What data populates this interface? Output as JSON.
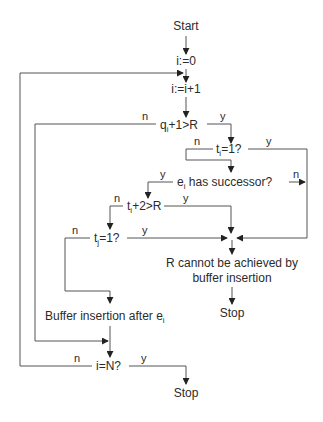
{
  "diagram": {
    "type": "flowchart",
    "nodes": {
      "start": "Start",
      "init": "i:=0",
      "increment": "i:=i+1",
      "q_check": {
        "pre": "q",
        "sub": "i",
        "post": "+1>R"
      },
      "ti_check": {
        "pre": "t",
        "sub": "i",
        "post": "=1?"
      },
      "successor": {
        "pre": "e",
        "sub": "i",
        "post": " has successor?"
      },
      "ti2_check": {
        "pre": "t",
        "sub": "i",
        "post": "+2>R"
      },
      "tj_check": {
        "pre": "t",
        "sub": "j",
        "post": "=1?"
      },
      "fail_line1": "R cannot be achieved by",
      "fail_line2": "buffer insertion",
      "stop1": "Stop",
      "buffer": {
        "pre": "Buffer insertion after e",
        "sub": "i"
      },
      "n_check": "i=N?",
      "stop2": "Stop"
    },
    "branch_labels": {
      "yes": "y",
      "no": "n"
    },
    "colors": {
      "line": "#555555",
      "arrow": "#222222",
      "text": "#2b2b2b",
      "background": "#ffffff"
    }
  }
}
